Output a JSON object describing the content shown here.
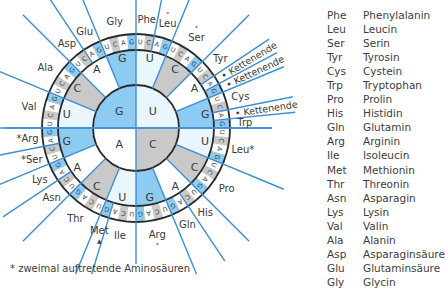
{
  "colors": {
    "line": "#3b8fd6",
    "blue_fill": "#8ecbf2",
    "gray_fill": "#c9c9c9",
    "light_fill": "#e9f6fd",
    "white_fill": "#ffffff",
    "circle_stroke": "#2a2a2a",
    "text": "#3a3a3a"
  },
  "wheel": {
    "center": [
      136,
      128
    ],
    "inner_bases": [
      {
        "base": "U",
        "start": 0
      },
      {
        "base": "C",
        "start": 90
      },
      {
        "base": "A",
        "start": 180
      },
      {
        "base": "G",
        "start": 270
      }
    ],
    "base_order": [
      "U",
      "C",
      "A",
      "G"
    ],
    "amino_acids": [
      {
        "label": "Phe",
        "start": 0,
        "end": 11.25
      },
      {
        "label": "Leu",
        "mark": "*",
        "start": 11.25,
        "end": 22.5
      },
      {
        "label": "Ser",
        "mark": "*",
        "start": 22.5,
        "end": 45
      },
      {
        "label": "Tyr",
        "start": 45,
        "end": 56.25
      },
      {
        "label": "• Kettenende",
        "start": 56.25,
        "end": 61.875,
        "rotated": true
      },
      {
        "label": "• Kettenende",
        "start": 61.875,
        "end": 67.5,
        "rotated": true
      },
      {
        "label": "Cys",
        "start": 67.5,
        "end": 78.75
      },
      {
        "label": "• Kettenende",
        "start": 78.75,
        "end": 84.375,
        "rotated": true
      },
      {
        "label": "Trp",
        "start": 84.375,
        "end": 90
      },
      {
        "label": "Leu*",
        "start": 90,
        "end": 112.5
      },
      {
        "label": "Pro",
        "start": 112.5,
        "end": 135
      },
      {
        "label": "His",
        "start": 135,
        "end": 146.25
      },
      {
        "label": "Gln",
        "start": 146.25,
        "end": 157.5
      },
      {
        "label": "Arg",
        "mark": "*",
        "start": 157.5,
        "end": 180
      },
      {
        "label": "Ile",
        "start": 180,
        "end": 196.875
      },
      {
        "label": "Met",
        "mark": "▲",
        "start": 196.875,
        "end": 202.5
      },
      {
        "label": "Thr",
        "start": 202.5,
        "end": 225
      },
      {
        "label": "Asn",
        "start": 225,
        "end": 236.25
      },
      {
        "label": "Lys",
        "start": 236.25,
        "end": 247.5
      },
      {
        "label": "*Ser",
        "start": 247.5,
        "end": 258.75
      },
      {
        "label": "*Arg",
        "start": 258.75,
        "end": 270
      },
      {
        "label": "Val",
        "start": 270,
        "end": 292.5
      },
      {
        "label": "Ala",
        "start": 292.5,
        "end": 315
      },
      {
        "label": "Asp",
        "start": 315,
        "end": 326.25
      },
      {
        "label": "Glu",
        "start": 326.25,
        "end": 337.5
      },
      {
        "label": "Gly",
        "start": 337.5,
        "end": 360
      }
    ]
  },
  "legend": [
    {
      "abbr": "Phe",
      "name": "Phenylalanin"
    },
    {
      "abbr": "Leu",
      "name": "Leucin"
    },
    {
      "abbr": "Ser",
      "name": "Serin"
    },
    {
      "abbr": "Tyr",
      "name": "Tyrosin"
    },
    {
      "abbr": "Cys",
      "name": "Cystein"
    },
    {
      "abbr": "Trp",
      "name": "Tryptophan"
    },
    {
      "abbr": "Pro",
      "name": "Prolin"
    },
    {
      "abbr": "His",
      "name": "Histidin"
    },
    {
      "abbr": "Gln",
      "name": "Glutamin"
    },
    {
      "abbr": "Arg",
      "name": "Arginin"
    },
    {
      "abbr": "Ile",
      "name": "Isoleucin"
    },
    {
      "abbr": "Met",
      "name": "Methionin"
    },
    {
      "abbr": "Thr",
      "name": "Threonin"
    },
    {
      "abbr": "Asn",
      "name": "Asparagin"
    },
    {
      "abbr": "Lys",
      "name": "Lysin"
    },
    {
      "abbr": "Val",
      "name": "Valin"
    },
    {
      "abbr": "Ala",
      "name": "Alanin"
    },
    {
      "abbr": "Asp",
      "name": "Asparaginsäure"
    },
    {
      "abbr": "Glu",
      "name": "Glutaminsäure"
    },
    {
      "abbr": "Gly",
      "name": "Glycin"
    }
  ],
  "footnote": "* zweimal auftretende Aminosäuren"
}
